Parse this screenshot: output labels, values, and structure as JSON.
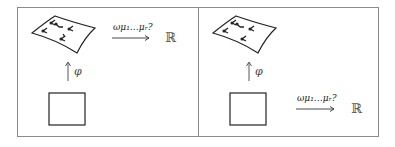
{
  "diagram": {
    "panels": [
      {
        "id": "left",
        "map_label": "ω_{μ1…μr}?",
        "map_label_text": "ωμ₁…μᵣ?",
        "pullback_label": "φ",
        "target_label": "ℝ",
        "map_source": "manifold"
      },
      {
        "id": "right",
        "map_label": "ω_{μ1…μr}?",
        "map_label_text": "ωμ₁…μᵣ?",
        "pullback_label": "φ",
        "target_label": "ℝ",
        "map_source": "coordinate-square"
      }
    ],
    "colors": {
      "stroke": "#222222",
      "frame": "#8a8a8a",
      "background": "#ffffff"
    }
  }
}
